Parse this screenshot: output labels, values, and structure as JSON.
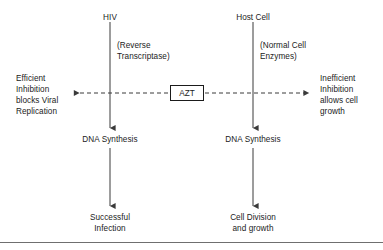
{
  "diagram": {
    "line_color": "#3a3a3a",
    "text_color": "#1b1b1b",
    "rule_color": "#6f6f6f",
    "background": "#ffffff",
    "nodes": {
      "hiv": "HIV",
      "host_cell": "Host Cell",
      "reverse_transcriptase": "(Reverse\nTranscriptase)",
      "normal_cell_enzymes": "(Normal Cell\nEnzymes)",
      "left_outcome": "Efficient\nInhibition\nblocks Viral\nReplication",
      "right_outcome": "Inefficient\nInhibition\nallows cell\ngrowth",
      "azt": "AZT",
      "dna_synthesis_left": "DNA Synthesis",
      "dna_synthesis_right": "DNA Synthesis",
      "successful_infection": "Successful\nInfection",
      "cell_division": "Cell Division\nand growth"
    },
    "edges": [
      {
        "name": "hiv-to-dna-synthesis",
        "style": "solid",
        "direction": "down"
      },
      {
        "name": "host-cell-to-dna-synthesis",
        "style": "solid",
        "direction": "down"
      },
      {
        "name": "dna-synthesis-to-successful-infection",
        "style": "solid",
        "direction": "down"
      },
      {
        "name": "dna-synthesis-to-cell-division",
        "style": "solid",
        "direction": "down"
      },
      {
        "name": "azt-to-left-outcome",
        "style": "dashed",
        "direction": "left"
      },
      {
        "name": "azt-to-right-outcome",
        "style": "dashed",
        "direction": "right"
      }
    ]
  }
}
